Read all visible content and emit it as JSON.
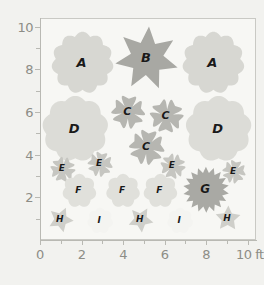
{
  "chart_data": {
    "type": "scatter",
    "title": "",
    "xlabel": "10 ft",
    "ylabel": "",
    "xlim": [
      0,
      10.4
    ],
    "ylim": [
      0,
      10.4
    ],
    "grid": false,
    "legend": null,
    "x_ticks": [
      {
        "value": 0,
        "label": "0",
        "major": true
      },
      {
        "value": 1,
        "label": "",
        "major": false
      },
      {
        "value": 2,
        "label": "2",
        "major": true
      },
      {
        "value": 3,
        "label": "",
        "major": false
      },
      {
        "value": 4,
        "label": "4",
        "major": true
      },
      {
        "value": 5,
        "label": "",
        "major": false
      },
      {
        "value": 6,
        "label": "6",
        "major": true
      },
      {
        "value": 7,
        "label": "",
        "major": false
      },
      {
        "value": 8,
        "label": "8",
        "major": true
      },
      {
        "value": 9,
        "label": "",
        "major": false
      },
      {
        "value": 10,
        "label": "10 ft",
        "major": true
      }
    ],
    "y_ticks": [
      {
        "value": 1,
        "label": "",
        "major": false
      },
      {
        "value": 2,
        "label": "2",
        "major": true
      },
      {
        "value": 3,
        "label": "",
        "major": false
      },
      {
        "value": 4,
        "label": "4",
        "major": true
      },
      {
        "value": 5,
        "label": "",
        "major": false
      },
      {
        "value": 6,
        "label": "6",
        "major": true
      },
      {
        "value": 7,
        "label": "",
        "major": false
      },
      {
        "value": 8,
        "label": "8",
        "major": true
      },
      {
        "value": 9,
        "label": "",
        "major": false
      },
      {
        "value": 10,
        "label": "10",
        "major": true
      }
    ],
    "points": [
      {
        "label": "A",
        "x": 2.0,
        "y": 8.35,
        "size": 62,
        "shape": "bloom-12",
        "color": "#d7d7d2"
      },
      {
        "label": "B",
        "x": 5.1,
        "y": 8.55,
        "size": 64,
        "shape": "star-7",
        "color": "#a8a8a3"
      },
      {
        "label": "A",
        "x": 8.3,
        "y": 8.35,
        "size": 62,
        "shape": "bloom-12",
        "color": "#d7d7d2"
      },
      {
        "label": "C",
        "x": 4.2,
        "y": 6.05,
        "size": 40,
        "shape": "petal-5",
        "color": "#b6b6b1"
      },
      {
        "label": "C",
        "x": 6.05,
        "y": 5.85,
        "size": 40,
        "shape": "petal-5",
        "color": "#b6b6b1"
      },
      {
        "label": "D",
        "x": 1.65,
        "y": 5.25,
        "size": 66,
        "shape": "bloom-10",
        "color": "#dcdcd7"
      },
      {
        "label": "D",
        "x": 8.55,
        "y": 5.25,
        "size": 66,
        "shape": "bloom-10",
        "color": "#dcdcd7"
      },
      {
        "label": "C",
        "x": 5.1,
        "y": 4.4,
        "size": 42,
        "shape": "petal-5",
        "color": "#b6b6b1"
      },
      {
        "label": "E",
        "x": 1.05,
        "y": 3.35,
        "size": 30,
        "shape": "petal-5",
        "color": "#c6c6c1"
      },
      {
        "label": "E",
        "x": 2.85,
        "y": 3.6,
        "size": 30,
        "shape": "petal-5",
        "color": "#c6c6c1"
      },
      {
        "label": "E",
        "x": 6.35,
        "y": 3.5,
        "size": 30,
        "shape": "petal-5",
        "color": "#c6c6c1"
      },
      {
        "label": "E",
        "x": 9.3,
        "y": 3.25,
        "size": 28,
        "shape": "petal-5",
        "color": "#c6c6c1"
      },
      {
        "label": "F",
        "x": 1.85,
        "y": 2.35,
        "size": 34,
        "shape": "bloom-8",
        "color": "#e0e0db"
      },
      {
        "label": "F",
        "x": 3.95,
        "y": 2.35,
        "size": 34,
        "shape": "bloom-8",
        "color": "#e0e0db"
      },
      {
        "label": "F",
        "x": 5.75,
        "y": 2.35,
        "size": 34,
        "shape": "bloom-8",
        "color": "#e0e0db"
      },
      {
        "label": "G",
        "x": 7.95,
        "y": 2.4,
        "size": 46,
        "shape": "sunburst",
        "color": "#a9a9a4"
      },
      {
        "label": "H",
        "x": 0.95,
        "y": 1.0,
        "size": 26,
        "shape": "star-5",
        "color": "#cfcfca"
      },
      {
        "label": "I",
        "x": 2.85,
        "y": 0.95,
        "size": 26,
        "shape": "bloom-8",
        "color": "#f4f4f1"
      },
      {
        "label": "H",
        "x": 4.8,
        "y": 1.0,
        "size": 26,
        "shape": "star-5",
        "color": "#cfcfca"
      },
      {
        "label": "I",
        "x": 6.7,
        "y": 0.95,
        "size": 26,
        "shape": "bloom-8",
        "color": "#f4f4f1"
      },
      {
        "label": "H",
        "x": 9.0,
        "y": 1.05,
        "size": 26,
        "shape": "star-5",
        "color": "#cfcfca"
      }
    ]
  },
  "colors": {
    "page_background": "#f2f2ef",
    "plot_background": "#f7f7f4",
    "axis": "#b9b9b3",
    "tick_text": "#8d8d86",
    "label_text": "#1a1a1a"
  }
}
